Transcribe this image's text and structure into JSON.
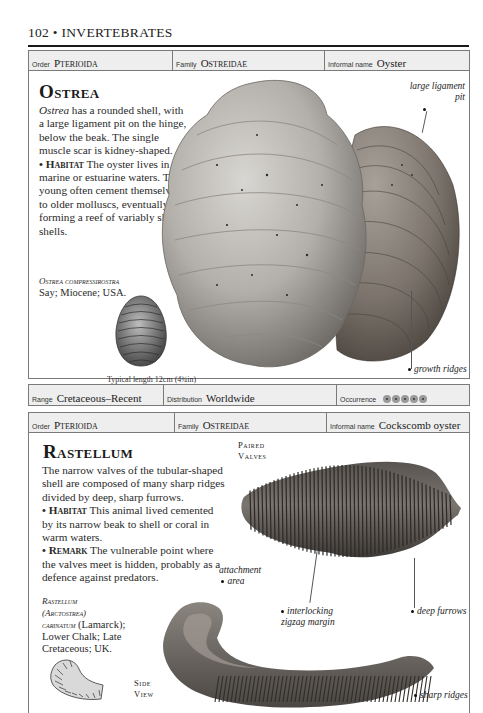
{
  "page": {
    "header": "102 • INVERTEBRATES"
  },
  "entries": [
    {
      "order_label": "Order",
      "order_value": "Pterioida",
      "family_label": "Family",
      "family_value": "Ostreidae",
      "informal_label": "Informal name",
      "informal_value": "Oyster",
      "title": "Ostrea",
      "description_italic": "Ostrea",
      "description_rest": " has a rounded shell, with a large ligament pit on the hinge, below the beak. The single muscle scar is kidney-shaped.",
      "habitat_label": "• Habitat",
      "habitat_text": " The oyster lives in marine or estuarine waters. The young often cement themselves to older molluscs, eventually forming a reef of variably shaped shells.",
      "caption_species": "Ostrea compressirostra",
      "caption_rest": "Say; Miocene; USA.",
      "typical_length": "Typical length 12cm (4¾in)",
      "labels": [
        "large ligament pit",
        "growth ridges"
      ],
      "range_label": "Range",
      "range_value": "Cretaceous–Recent",
      "distribution_label": "Distribution",
      "distribution_value": "Worldwide",
      "occurrence_label": "Occurrence",
      "occurrence_level": 5,
      "occurrence_max": 5
    },
    {
      "order_label": "Order",
      "order_value": "Pterioida",
      "family_label": "Family",
      "family_value": "Ostreidae",
      "informal_label": "Informal name",
      "informal_value": "Cockscomb oyster",
      "title": "Rastellum",
      "description_rest": "The narrow valves of the tubular-shaped shell are composed of many sharp ridges divided by deep, sharp furrows.",
      "habitat_label": "• Habitat",
      "habitat_text": " This animal lived cemented by its narrow beak to shell or coral in warm waters.",
      "remark_label": "• Remark",
      "remark_text": " The vulnerable point where the valves meet is hidden, probably as a defence against predators.",
      "caption_species_1": "Rastellum",
      "caption_species_2": "(Arctostrea)",
      "caption_species_3": "carinatum",
      "caption_rest_1": " (Lamarck);",
      "caption_rest_2": "Lower Chalk; Late Cretaceous; UK.",
      "view_paired_1": "Paired",
      "view_paired_2": "Valves",
      "view_side_1": "Side",
      "view_side_2": "View",
      "labels": [
        "attachment area",
        "interlocking zigzag margin",
        "deep furrows",
        "sharp ridges"
      ],
      "label_lines": {
        "attachment_1": "attachment",
        "attachment_2": "area",
        "zigzag_1": "interlocking",
        "zigzag_2": "zigzag margin"
      }
    }
  ]
}
